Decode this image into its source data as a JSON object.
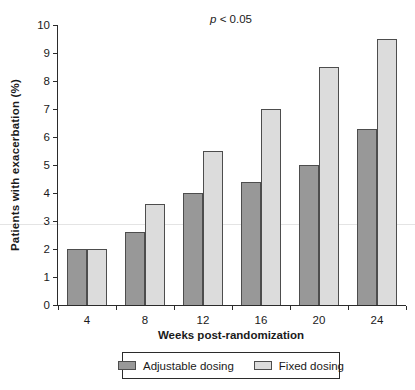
{
  "chart_data": {
    "type": "bar",
    "annotation": {
      "variable": "p",
      "comparison": " < 0.05",
      "text": "p < 0.05"
    },
    "xlabel": "Weeks post-randomization",
    "ylabel": "Patients with exacerbation (%)",
    "ylim": [
      0,
      10
    ],
    "ytick_step": 1,
    "grid": false,
    "legend_position": "bottom",
    "categories": [
      "4",
      "8",
      "12",
      "16",
      "20",
      "24"
    ],
    "series": [
      {
        "name": "Adjustable dosing",
        "color": "#989898",
        "values": [
          2.0,
          2.6,
          4.0,
          4.4,
          5.0,
          6.3
        ]
      },
      {
        "name": "Fixed dosing",
        "color": "#dcdcdc",
        "values": [
          2.0,
          3.6,
          5.5,
          7.0,
          8.5,
          9.5
        ]
      }
    ],
    "bar_border_color": "#4d4d4d"
  }
}
